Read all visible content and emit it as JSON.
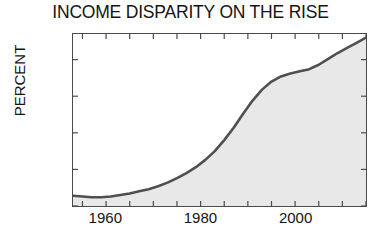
{
  "chart_data": {
    "type": "area",
    "title": "INCOME DISPARITY ON THE RISE",
    "xlabel": "",
    "ylabel": "PERCENT",
    "ylim": [
      110,
      133.5
    ],
    "xlim": [
      1953,
      2015
    ],
    "grid": false,
    "legend": null,
    "yticks": [
      110,
      115,
      120,
      125,
      130
    ],
    "ytick_labels": [
      "110",
      "115",
      "120",
      "125",
      "130"
    ],
    "xticks": [
      1955,
      1960,
      1965,
      1970,
      1975,
      1980,
      1985,
      1990,
      1995,
      2000,
      2005,
      2010,
      2015
    ],
    "xtick_labels_shown": [
      "1960",
      "1980",
      "2000"
    ],
    "xtick_label_values": [
      1960,
      1980,
      2000
    ],
    "line_color": "#4f4f4f",
    "fill_color": "#e8e8e8",
    "axis_color": "#4a4a4a",
    "series": [
      {
        "name": "Income disparity",
        "x": [
          1953,
          1955,
          1957,
          1959,
          1961,
          1963,
          1965,
          1967,
          1969,
          1971,
          1973,
          1975,
          1977,
          1979,
          1981,
          1983,
          1985,
          1987,
          1989,
          1991,
          1993,
          1995,
          1997,
          1999,
          2001,
          2003,
          2005,
          2007,
          2009,
          2011,
          2013,
          2015
        ],
        "values": [
          111.4,
          111.3,
          111.2,
          111.2,
          111.3,
          111.5,
          111.7,
          112.0,
          112.3,
          112.7,
          113.2,
          113.8,
          114.5,
          115.3,
          116.3,
          117.5,
          119.0,
          120.7,
          122.6,
          124.4,
          125.9,
          127.0,
          127.7,
          128.1,
          128.4,
          128.7,
          129.3,
          130.1,
          130.9,
          131.6,
          132.3,
          133.0
        ]
      }
    ]
  },
  "axis": {
    "y_title": "PERCENT"
  }
}
